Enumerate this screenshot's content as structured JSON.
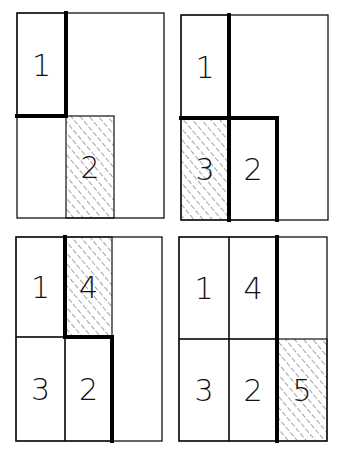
{
  "diagram": {
    "panels": [
      {
        "step": 1,
        "cells": [
          {
            "label": "1",
            "col": 0,
            "row": 0,
            "hatched": false
          },
          {
            "label": "2",
            "col": 1,
            "row": 1,
            "hatched": true
          }
        ],
        "heavy_edges": [
          [
            1,
            0,
            1,
            1
          ],
          [
            0,
            1,
            1,
            1
          ]
        ]
      },
      {
        "step": 2,
        "cells": [
          {
            "label": "1",
            "col": 0,
            "row": 0,
            "hatched": false
          },
          {
            "label": "3",
            "col": 0,
            "row": 1,
            "hatched": true
          },
          {
            "label": "2",
            "col": 1,
            "row": 1,
            "hatched": false
          }
        ],
        "heavy_edges": [
          [
            1,
            0,
            1,
            2
          ],
          [
            0,
            1,
            2,
            1
          ],
          [
            2,
            1,
            2,
            2
          ]
        ]
      },
      {
        "step": 3,
        "cells": [
          {
            "label": "1",
            "col": 0,
            "row": 0,
            "hatched": false
          },
          {
            "label": "4",
            "col": 1,
            "row": 0,
            "hatched": true
          },
          {
            "label": "3",
            "col": 0,
            "row": 1,
            "hatched": false
          },
          {
            "label": "2",
            "col": 1,
            "row": 1,
            "hatched": false
          }
        ],
        "heavy_edges": [
          [
            1,
            0,
            1,
            1
          ],
          [
            1,
            1,
            2,
            1
          ],
          [
            2,
            1,
            2,
            2
          ]
        ]
      },
      {
        "step": 4,
        "cells": [
          {
            "label": "1",
            "col": 0,
            "row": 0,
            "hatched": false
          },
          {
            "label": "4",
            "col": 1,
            "row": 0,
            "hatched": false
          },
          {
            "label": "3",
            "col": 0,
            "row": 1,
            "hatched": false
          },
          {
            "label": "2",
            "col": 1,
            "row": 1,
            "hatched": false
          },
          {
            "label": "5",
            "col": 2,
            "row": 1,
            "hatched": true
          }
        ],
        "heavy_edges": [
          [
            2,
            0,
            2,
            2
          ]
        ]
      }
    ]
  }
}
